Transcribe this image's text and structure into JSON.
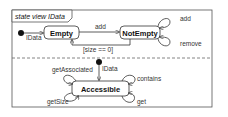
{
  "diagram": {
    "title": "state view IData",
    "regions": [
      {
        "initial_label": "IData",
        "states": [
          {
            "id": "empty",
            "label": "Empty"
          },
          {
            "id": "notempty",
            "label": "NotEmpty"
          }
        ],
        "transitions": [
          {
            "from": "empty",
            "to": "notempty",
            "label": "add"
          },
          {
            "from": "notempty",
            "to": "empty",
            "label": "[size == 0]"
          },
          {
            "from": "notempty",
            "to": "notempty",
            "label": "add"
          },
          {
            "from": "notempty",
            "to": "notempty",
            "label": "remove"
          }
        ]
      },
      {
        "initial_label": "IData",
        "states": [
          {
            "id": "accessible",
            "label": "Accessible"
          }
        ],
        "transitions": [
          {
            "from": "accessible",
            "to": "accessible",
            "label": "getAssociated"
          },
          {
            "from": "accessible",
            "to": "accessible",
            "label": "getSize"
          },
          {
            "from": "accessible",
            "to": "accessible",
            "label": "contains"
          },
          {
            "from": "accessible",
            "to": "accessible",
            "label": "get"
          }
        ]
      }
    ]
  }
}
